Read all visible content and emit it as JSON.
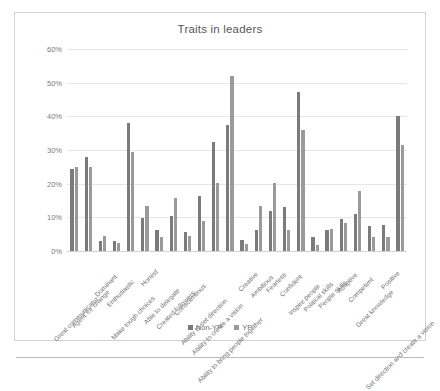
{
  "frame": {
    "border_color": "#cfd3d8"
  },
  "legend": {
    "position": "bottom-center",
    "entries": [
      {
        "label": "Non-YP",
        "color": "#7b7b7b",
        "swatch_icon": "square-swatch-icon"
      },
      {
        "label": "YP",
        "color": "#9a9a9a",
        "swatch_icon": "square-swatch-icon"
      }
    ]
  },
  "chart_data": {
    "type": "bar",
    "title": "Traits in leaders",
    "xlabel": "",
    "ylabel": "",
    "ylim": [
      0,
      60
    ],
    "ytick_labels": [
      "0%",
      "10%",
      "20%",
      "30%",
      "40%",
      "50%",
      "60%"
    ],
    "ytick_values": [
      0,
      10,
      20,
      30,
      40,
      50,
      60
    ],
    "grid": true,
    "value_unit": "percent",
    "categories": [
      "Great communicator",
      "Agent for change",
      "Dominant",
      "Enthusiastic",
      "Make tough choices",
      "Honest",
      "Able to delegate",
      "Created followers",
      "Conscientious",
      "Ability to set direction",
      "Ability to create a vision",
      "Ability to bring people together",
      "Creative",
      "Ambitious",
      "Fearless",
      "Confident",
      "Inspire people",
      "Political skills",
      "People skills",
      "Adaptive",
      "Competent",
      "Great knowledge",
      "Positive",
      "Set direction and create a vision"
    ],
    "series": [
      {
        "name": "Non-YP",
        "color": "#7b7b7b",
        "values": [
          24.4,
          28.0,
          3.0,
          3.0,
          38.0,
          9.7,
          6.2,
          10.3,
          5.5,
          16.4,
          32.5,
          37.3,
          3.3,
          6.2,
          11.8,
          13.1,
          47.2,
          4.3,
          6.1,
          9.4,
          11.0,
          7.3,
          7.6,
          40.0
        ]
      },
      {
        "name": "YP",
        "color": "#9a9a9a",
        "values": [
          24.9,
          24.9,
          4.4,
          2.3,
          29.3,
          13.3,
          4.3,
          15.7,
          4.4,
          8.8,
          20.1,
          52.0,
          2.0,
          13.3,
          20.1,
          6.3,
          35.9,
          1.8,
          6.4,
          8.4,
          17.7,
          4.2,
          4.1,
          31.4
        ]
      }
    ]
  }
}
